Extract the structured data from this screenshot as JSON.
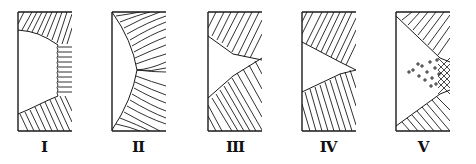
{
  "figure": {
    "panels": [
      {
        "id": "I",
        "label": "I",
        "cx": 44,
        "structure": "columnar-top-bottom, horizontal-columnar-center"
      },
      {
        "id": "II",
        "label": "II",
        "cx": 138,
        "structure": "curved-radial-columnar"
      },
      {
        "id": "III",
        "label": "III",
        "cx": 235,
        "structure": "V-shaped-columnar-meeting-center"
      },
      {
        "id": "IV",
        "label": "IV",
        "cx": 328,
        "structure": "V-shaped-columnar-inclined"
      },
      {
        "id": "V",
        "label": "V",
        "cx": 423,
        "structure": "columnar-with-equiaxed-center"
      }
    ],
    "colors": {
      "ink": "#1a1a1a",
      "background": "#ffffff"
    }
  }
}
